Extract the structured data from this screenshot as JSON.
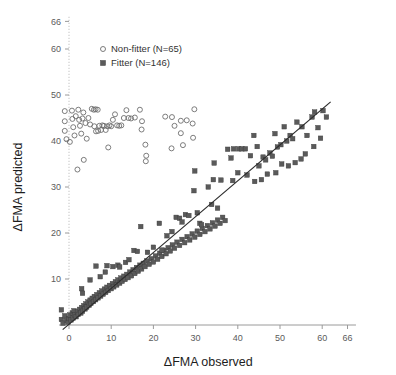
{
  "chart_data": {
    "type": "scatter",
    "title": "",
    "xlabel": "ΔFMA observed",
    "ylabel": "ΔFMA predicted",
    "xlim": [
      -3,
      68
    ],
    "ylim": [
      -1,
      68
    ],
    "xticks": [
      0,
      10,
      20,
      30,
      40,
      50,
      60,
      66
    ],
    "yticks": [
      10,
      20,
      30,
      40,
      50,
      60,
      66
    ],
    "xticklabels": [
      "0",
      "10",
      "20",
      "30",
      "40",
      "50",
      "60",
      "66"
    ],
    "yticklabels": [
      "10",
      "20",
      "30",
      "40",
      "50",
      "60",
      "66"
    ],
    "grid": false,
    "legend_position": "top-center",
    "legend": [
      {
        "label": "Non-fitter  (N=65)",
        "marker": "open-circle",
        "color": "#6e6e6e",
        "n": 65
      },
      {
        "label": "Fitter  (N=146)",
        "marker": "filled-square",
        "color": "#5a5a5a",
        "n": 146
      }
    ],
    "reference_line": {
      "label": "identity-fit-line",
      "x": [
        -1.5,
        62
      ],
      "y": [
        -1.0,
        48.5
      ],
      "color": "#2b2b2b"
    },
    "series": [
      {
        "name": "Non-fitter  (N=65)",
        "marker": "open-circle",
        "color": "#6e6e6e",
        "points": [
          [
            -1.0,
            46.5
          ],
          [
            -1.0,
            44.3
          ],
          [
            -1.0,
            42.2
          ],
          [
            -0.6,
            40.4
          ],
          [
            0.2,
            39.8
          ],
          [
            0.7,
            46.6
          ],
          [
            0.8,
            44.8
          ],
          [
            1.0,
            43.0
          ],
          [
            1.3,
            41.2
          ],
          [
            1.6,
            45.4
          ],
          [
            2.2,
            46.8
          ],
          [
            2.4,
            44.6
          ],
          [
            2.6,
            43.3
          ],
          [
            2.9,
            41.6
          ],
          [
            3.2,
            44.9
          ],
          [
            3.4,
            46.2
          ],
          [
            3.9,
            43.9
          ],
          [
            4.2,
            40.5
          ],
          [
            4.6,
            45.0
          ],
          [
            5.0,
            43.6
          ],
          [
            5.4,
            47.0
          ],
          [
            5.9,
            46.8
          ],
          [
            6.3,
            46.9
          ],
          [
            6.8,
            46.8
          ],
          [
            6.0,
            43.2
          ],
          [
            6.4,
            42.1
          ],
          [
            6.9,
            42.2
          ],
          [
            7.2,
            43.3
          ],
          [
            7.6,
            42.4
          ],
          [
            7.9,
            43.4
          ],
          [
            8.3,
            43.3
          ],
          [
            8.7,
            42.4
          ],
          [
            9.1,
            43.2
          ],
          [
            9.6,
            43.4
          ],
          [
            10.0,
            43.2
          ],
          [
            10.4,
            44.6
          ],
          [
            10.9,
            45.8
          ],
          [
            11.4,
            43.4
          ],
          [
            11.9,
            43.3
          ],
          [
            12.4,
            43.4
          ],
          [
            13.0,
            45.0
          ],
          [
            13.6,
            46.7
          ],
          [
            14.1,
            45.0
          ],
          [
            14.7,
            44.9
          ],
          [
            15.6,
            45.1
          ],
          [
            16.8,
            46.8
          ],
          [
            17.3,
            44.3
          ],
          [
            3.5,
            35.9
          ],
          [
            2.0,
            33.8
          ],
          [
            9.3,
            38.6
          ],
          [
            17.2,
            42.5
          ],
          [
            18.1,
            39.2
          ],
          [
            18.3,
            36.8
          ],
          [
            18.2,
            35.6
          ],
          [
            22.8,
            45.3
          ],
          [
            24.4,
            45.2
          ],
          [
            25.0,
            43.3
          ],
          [
            26.5,
            41.7
          ],
          [
            27.0,
            39.1
          ],
          [
            26.5,
            44.4
          ],
          [
            27.9,
            44.5
          ],
          [
            29.7,
            46.9
          ],
          [
            29.3,
            43.8
          ],
          [
            29.4,
            40.7
          ],
          [
            24.3,
            38.4
          ]
        ]
      },
      {
        "name": "Fitter  (N=146)",
        "marker": "filled-square",
        "color": "#5a5a5a",
        "points": [
          [
            -1.8,
            3.3
          ],
          [
            -1.8,
            1.2
          ],
          [
            -1.4,
            0.4
          ],
          [
            -1.0,
            2.0
          ],
          [
            -0.6,
            1.0
          ],
          [
            -0.2,
            0.6
          ],
          [
            0.0,
            1.4
          ],
          [
            0.2,
            2.2
          ],
          [
            0.5,
            1.1
          ],
          [
            0.8,
            2.6
          ],
          [
            1.0,
            1.5
          ],
          [
            1.2,
            3.1
          ],
          [
            1.4,
            2.2
          ],
          [
            1.7,
            1.8
          ],
          [
            2.0,
            2.9
          ],
          [
            2.2,
            2.3
          ],
          [
            2.5,
            3.4
          ],
          [
            2.8,
            2.6
          ],
          [
            3.0,
            3.8
          ],
          [
            3.2,
            3.0
          ],
          [
            3.5,
            4.2
          ],
          [
            3.8,
            3.5
          ],
          [
            4.0,
            4.6
          ],
          [
            4.2,
            3.9
          ],
          [
            4.5,
            5.0
          ],
          [
            4.8,
            4.3
          ],
          [
            5.0,
            5.4
          ],
          [
            5.2,
            4.7
          ],
          [
            5.5,
            5.8
          ],
          [
            5.8,
            5.1
          ],
          [
            6.0,
            6.2
          ],
          [
            6.3,
            5.5
          ],
          [
            6.6,
            6.6
          ],
          [
            6.9,
            5.9
          ],
          [
            7.2,
            7.0
          ],
          [
            7.5,
            6.3
          ],
          [
            7.8,
            7.4
          ],
          [
            8.1,
            6.7
          ],
          [
            8.4,
            7.8
          ],
          [
            8.7,
            7.1
          ],
          [
            9.0,
            8.2
          ],
          [
            9.3,
            7.5
          ],
          [
            9.6,
            8.6
          ],
          [
            10.0,
            7.9
          ],
          [
            10.3,
            9.0
          ],
          [
            10.6,
            8.3
          ],
          [
            11.0,
            9.4
          ],
          [
            11.3,
            8.7
          ],
          [
            11.6,
            9.8
          ],
          [
            12.0,
            9.1
          ],
          [
            12.3,
            10.2
          ],
          [
            12.6,
            9.5
          ],
          [
            13.0,
            10.6
          ],
          [
            13.3,
            9.9
          ],
          [
            13.7,
            11.0
          ],
          [
            14.0,
            10.3
          ],
          [
            14.4,
            11.5
          ],
          [
            14.8,
            10.7
          ],
          [
            15.2,
            12.0
          ],
          [
            15.6,
            11.2
          ],
          [
            16.0,
            12.5
          ],
          [
            16.4,
            11.7
          ],
          [
            16.8,
            13.0
          ],
          [
            17.2,
            12.2
          ],
          [
            17.6,
            13.4
          ],
          [
            18.0,
            12.7
          ],
          [
            18.5,
            13.9
          ],
          [
            19.0,
            13.2
          ],
          [
            19.5,
            14.4
          ],
          [
            20.0,
            13.7
          ],
          [
            20.5,
            15.0
          ],
          [
            21.0,
            14.3
          ],
          [
            21.5,
            15.6
          ],
          [
            22.0,
            14.9
          ],
          [
            22.5,
            16.2
          ],
          [
            23.0,
            15.5
          ],
          [
            23.5,
            16.8
          ],
          [
            24.0,
            16.1
          ],
          [
            24.5,
            17.4
          ],
          [
            25.0,
            16.7
          ],
          [
            25.6,
            18.0
          ],
          [
            26.2,
            17.3
          ],
          [
            26.8,
            18.6
          ],
          [
            27.4,
            17.9
          ],
          [
            28.0,
            19.2
          ],
          [
            28.6,
            18.5
          ],
          [
            29.2,
            19.8
          ],
          [
            29.8,
            19.1
          ],
          [
            30.4,
            20.4
          ],
          [
            31.0,
            19.7
          ],
          [
            31.6,
            21.0
          ],
          [
            32.2,
            20.3
          ],
          [
            32.8,
            21.6
          ],
          [
            33.4,
            20.9
          ],
          [
            34.0,
            22.2
          ],
          [
            34.6,
            21.5
          ],
          [
            35.2,
            22.8
          ],
          [
            35.8,
            22.1
          ],
          [
            36.4,
            23.4
          ],
          [
            37.0,
            22.7
          ],
          [
            3.0,
            7.9
          ],
          [
            3.2,
            6.9
          ],
          [
            5.0,
            9.8
          ],
          [
            6.4,
            12.8
          ],
          [
            7.4,
            10.5
          ],
          [
            8.6,
            11.5
          ],
          [
            9.0,
            12.9
          ],
          [
            10.4,
            12.7
          ],
          [
            11.6,
            13.0
          ],
          [
            12.0,
            12.6
          ],
          [
            13.4,
            13.6
          ],
          [
            14.2,
            14.2
          ],
          [
            15.4,
            16.2
          ],
          [
            16.2,
            16.0
          ],
          [
            17.0,
            21.4
          ],
          [
            18.6,
            15.8
          ],
          [
            20.0,
            16.9
          ],
          [
            21.4,
            22.1
          ],
          [
            22.0,
            16.3
          ],
          [
            23.2,
            19.4
          ],
          [
            24.4,
            20.3
          ],
          [
            25.4,
            23.4
          ],
          [
            26.2,
            23.2
          ],
          [
            26.8,
            22.4
          ],
          [
            27.6,
            24.0
          ],
          [
            28.4,
            23.8
          ],
          [
            29.6,
            29.2
          ],
          [
            30.4,
            24.4
          ],
          [
            31.0,
            22.1
          ],
          [
            31.4,
            21.8
          ],
          [
            33.8,
            26.2
          ],
          [
            35.2,
            25.4
          ],
          [
            29.8,
            33.5
          ],
          [
            34.4,
            35.2
          ],
          [
            37.6,
            38.2
          ],
          [
            38.4,
            36.3
          ],
          [
            39.0,
            38.3
          ],
          [
            40.2,
            38.3
          ],
          [
            41.0,
            38.3
          ],
          [
            41.8,
            38.3
          ],
          [
            43.0,
            36.8
          ],
          [
            43.8,
            41.2
          ],
          [
            44.6,
            38.8
          ],
          [
            45.0,
            34.6
          ],
          [
            46.0,
            36.5
          ],
          [
            46.6,
            35.9
          ],
          [
            47.6,
            37.4
          ],
          [
            48.2,
            36.7
          ],
          [
            48.8,
            41.6
          ],
          [
            49.4,
            38.7
          ],
          [
            50.2,
            39.2
          ],
          [
            51.0,
            43.1
          ],
          [
            51.6,
            40.0
          ],
          [
            52.4,
            41.2
          ],
          [
            53.0,
            40.5
          ],
          [
            54.0,
            44.1
          ],
          [
            55.2,
            43.1
          ],
          [
            56.4,
            41.2
          ],
          [
            57.6,
            45.2
          ],
          [
            58.2,
            46.3
          ],
          [
            59.0,
            42.9
          ],
          [
            60.2,
            46.6
          ],
          [
            61.0,
            45.2
          ],
          [
            36.0,
            31.5
          ],
          [
            38.8,
            31.4
          ],
          [
            33.0,
            30.0
          ],
          [
            34.2,
            31.6
          ],
          [
            40.0,
            33.1
          ],
          [
            42.2,
            32.6
          ],
          [
            44.0,
            31.2
          ],
          [
            45.6,
            31.6
          ],
          [
            47.0,
            32.8
          ],
          [
            49.0,
            33.1
          ],
          [
            50.4,
            35.0
          ],
          [
            52.0,
            34.6
          ],
          [
            53.6,
            35.3
          ],
          [
            55.0,
            36.1
          ],
          [
            56.0,
            37.2
          ],
          [
            58.0,
            38.8
          ],
          [
            59.6,
            40.6
          ]
        ]
      }
    ]
  }
}
